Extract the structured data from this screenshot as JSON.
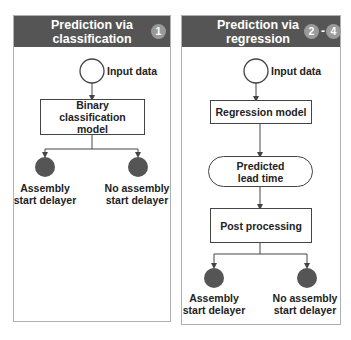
{
  "panels": [
    {
      "id": "classification",
      "title": "Prediction via classification",
      "title_line1": "Prediction via",
      "title_line2": "classification",
      "badges": [
        "1"
      ],
      "nodes": {
        "input": "Input data",
        "model": "Binary classification model",
        "outcome_left": {
          "line1": "Assembly",
          "line2": "start delayer"
        },
        "outcome_right": {
          "line1": "No assembly",
          "line2": "start delayer"
        }
      }
    },
    {
      "id": "regression",
      "title": "Prediction via regression",
      "title_line1": "Prediction via",
      "title_line2": "regression",
      "badges": [
        "2",
        "4"
      ],
      "badge_separator": "-",
      "nodes": {
        "input": "Input data",
        "model": "Regression model",
        "intermediate": "Predicted lead time",
        "post": "Post processing",
        "outcome_left": {
          "line1": "Assembly",
          "line2": "start delayer"
        },
        "outcome_right": {
          "line1": "No assembly",
          "line2": "start delayer"
        }
      }
    }
  ],
  "colors": {
    "header_bg": "#555555",
    "badge_bg": "#9a9a9a",
    "outcome_fill": "#555555",
    "line": "#444444",
    "panel_border": "#b0b0b0"
  }
}
